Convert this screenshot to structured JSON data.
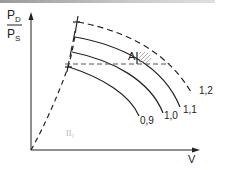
{
  "diagram": {
    "y_axis": {
      "numerator": "P",
      "numerator_sub": "D",
      "denominator": "P",
      "denominator_sub": "S"
    },
    "x_axis": {
      "label": "V",
      "dot": "·"
    },
    "point_label": "A",
    "faint_label": "II₂",
    "curves": [
      {
        "label": "0,9",
        "style": "solid"
      },
      {
        "label": "1,0",
        "style": "solid"
      },
      {
        "label": "1,1",
        "style": "solid"
      },
      {
        "label": "1,2",
        "style": "dashed"
      }
    ],
    "colors": {
      "line": "#222222",
      "hatch": "#999999",
      "faint": "#b0b0b0"
    }
  }
}
